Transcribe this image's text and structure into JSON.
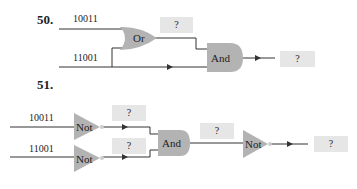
{
  "problems": [
    {
      "number": "50.",
      "inputs": [
        "10011",
        "11001"
      ],
      "gates": [
        {
          "type": "Or",
          "label": "Or"
        },
        {
          "type": "And",
          "label": "And"
        }
      ],
      "unknowns": [
        "?",
        "?"
      ]
    },
    {
      "number": "51.",
      "inputs": [
        "10011",
        "11001"
      ],
      "gates": [
        {
          "type": "Not",
          "label": "Not"
        },
        {
          "type": "Not",
          "label": "Not"
        },
        {
          "type": "And",
          "label": "And"
        },
        {
          "type": "Not",
          "label": "Not"
        }
      ],
      "unknowns": [
        "?",
        "?",
        "?",
        "?"
      ]
    }
  ],
  "colors": {
    "gate_fill": "#b3b3b3",
    "answer_box": "#e6e6e6",
    "wire": "#333333"
  }
}
